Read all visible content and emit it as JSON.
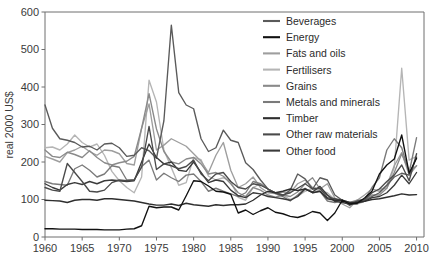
{
  "chart_data": {
    "type": "line",
    "title": "",
    "xlabel": "",
    "ylabel": "real 2000 US$",
    "xlim": [
      1960,
      2011
    ],
    "ylim": [
      0,
      600
    ],
    "xticks": [
      1960,
      1965,
      1970,
      1975,
      1980,
      1985,
      1990,
      1995,
      2000,
      2005,
      2010
    ],
    "yticks": [
      0,
      100,
      200,
      300,
      400,
      500,
      600
    ],
    "grid": false,
    "legend_position": "top-right",
    "x": [
      1960,
      1961,
      1962,
      1963,
      1964,
      1965,
      1966,
      1967,
      1968,
      1969,
      1970,
      1971,
      1972,
      1973,
      1974,
      1975,
      1976,
      1977,
      1978,
      1979,
      1980,
      1981,
      1982,
      1983,
      1984,
      1985,
      1986,
      1987,
      1988,
      1989,
      1990,
      1991,
      1992,
      1993,
      1994,
      1995,
      1996,
      1997,
      1998,
      1999,
      2000,
      2001,
      2002,
      2003,
      2004,
      2005,
      2006,
      2007,
      2008,
      2009,
      2010
    ],
    "series": [
      {
        "name": "Beverages",
        "color": "#5a5a5a",
        "values": [
          352,
          290,
          262,
          258,
          252,
          240,
          242,
          232,
          248,
          250,
          238,
          215,
          218,
          238,
          230,
          210,
          310,
          565,
          385,
          352,
          342,
          262,
          228,
          238,
          285,
          258,
          252,
          198,
          180,
          152,
          128,
          118,
          110,
          125,
          168,
          155,
          128,
          158,
          152,
          112,
          98,
          84,
          96,
          98,
          108,
          118,
          138,
          160,
          170,
          165,
          212
        ]
      },
      {
        "name": "Energy",
        "color": "#111111",
        "values": [
          22,
          22,
          21,
          21,
          21,
          20,
          20,
          20,
          19,
          19,
          19,
          21,
          22,
          30,
          82,
          78,
          80,
          80,
          72,
          110,
          150,
          148,
          136,
          122,
          120,
          114,
          64,
          72,
          60,
          70,
          78,
          66,
          62,
          55,
          52,
          58,
          68,
          64,
          44,
          64,
          98,
          88,
          90,
          104,
          122,
          168,
          192,
          208,
          272,
          170,
          210
        ]
      },
      {
        "name": "Fats and oils",
        "color": "#9e9e9e",
        "values": [
          215,
          208,
          200,
          225,
          232,
          242,
          228,
          218,
          232,
          230,
          222,
          196,
          192,
          290,
          355,
          232,
          245,
          262,
          252,
          242,
          222,
          202,
          172,
          218,
          252,
          178,
          132,
          142,
          160,
          132,
          118,
          116,
          120,
          118,
          142,
          152,
          132,
          128,
          142,
          104,
          88,
          78,
          98,
          112,
          128,
          122,
          138,
          190,
          225,
          165,
          190
        ]
      },
      {
        "name": "Fertilisers",
        "color": "#b5b5b5",
        "values": [
          238,
          240,
          232,
          248,
          272,
          252,
          240,
          248,
          218,
          175,
          150,
          132,
          118,
          160,
          418,
          360,
          232,
          185,
          138,
          145,
          212,
          206,
          162,
          152,
          158,
          148,
          106,
          98,
          132,
          142,
          128,
          118,
          112,
          100,
          108,
          122,
          130,
          122,
          118,
          100,
          96,
          92,
          88,
          95,
          118,
          128,
          130,
          185,
          450,
          205,
          215
        ]
      },
      {
        "name": "Grains",
        "color": "#8a8a8a",
        "values": [
          232,
          215,
          212,
          226,
          220,
          212,
          230,
          212,
          198,
          192,
          198,
          202,
          215,
          290,
          382,
          288,
          228,
          200,
          195,
          208,
          212,
          195,
          168,
          172,
          162,
          142,
          118,
          108,
          132,
          125,
          112,
          106,
          112,
          108,
          120,
          142,
          158,
          128,
          112,
          100,
          98,
          92,
          98,
          100,
          112,
          112,
          130,
          172,
          222,
          175,
          190
        ]
      },
      {
        "name": "Metals and minerals",
        "color": "#7a7a7a",
        "values": [
          148,
          142,
          140,
          138,
          182,
          192,
          178,
          160,
          168,
          190,
          186,
          152,
          152,
          188,
          205,
          152,
          170,
          158,
          148,
          165,
          168,
          148,
          122,
          130,
          122,
          115,
          108,
          118,
          148,
          142,
          128,
          116,
          108,
          96,
          112,
          130,
          118,
          122,
          96,
          92,
          98,
          88,
          88,
          100,
          132,
          158,
          232,
          262,
          238,
          172,
          265
        ]
      },
      {
        "name": "Timber",
        "color": "#2e2e2e",
        "values": [
          98,
          97,
          96,
          92,
          98,
          100,
          100,
          98,
          102,
          102,
          100,
          98,
          96,
          92,
          88,
          85,
          85,
          88,
          84,
          90,
          86,
          84,
          82,
          86,
          84,
          86,
          86,
          88,
          98,
          112,
          122,
          118,
          122,
          128,
          124,
          128,
          118,
          122,
          102,
          98,
          98,
          92,
          92,
          95,
          100,
          102,
          106,
          110,
          115,
          112,
          113
        ]
      },
      {
        "name": "Other raw materials",
        "color": "#4a4a4a",
        "values": [
          132,
          125,
          122,
          196,
          172,
          148,
          122,
          120,
          125,
          145,
          152,
          150,
          152,
          186,
          295,
          180,
          195,
          190,
          182,
          188,
          205,
          168,
          150,
          168,
          172,
          148,
          132,
          128,
          142,
          138,
          128,
          118,
          112,
          118,
          130,
          142,
          128,
          130,
          105,
          102,
          98,
          88,
          95,
          100,
          118,
          128,
          148,
          165,
          192,
          150,
          222
        ]
      },
      {
        "name": "Other food",
        "color": "#3a3a3a",
        "values": [
          142,
          132,
          125,
          140,
          145,
          140,
          148,
          142,
          150,
          152,
          150,
          148,
          150,
          200,
          248,
          212,
          195,
          200,
          178,
          175,
          200,
          172,
          145,
          152,
          148,
          125,
          110,
          105,
          118,
          115,
          108,
          105,
          102,
          98,
          108,
          128,
          120,
          135,
          112,
          95,
          92,
          88,
          92,
          95,
          105,
          108,
          118,
          138,
          165,
          142,
          172
        ]
      }
    ]
  },
  "legend": {
    "entries": [
      {
        "label": "Beverages"
      },
      {
        "label": "Energy"
      },
      {
        "label": "Fats and oils"
      },
      {
        "label": "Fertilisers"
      },
      {
        "label": "Grains"
      },
      {
        "label": "Metals and minerals"
      },
      {
        "label": "Timber"
      },
      {
        "label": "Other raw materials"
      },
      {
        "label": "Other food"
      }
    ]
  }
}
